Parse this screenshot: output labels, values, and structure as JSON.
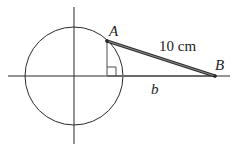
{
  "diagram": {
    "labels": {
      "point_a": "A",
      "point_b": "B",
      "segment_ab": "10 cm",
      "segment_b": "b"
    },
    "colors": {
      "stroke": "#2a2a2a",
      "segment_ab": "#555555",
      "segment_b": "#6a6a6a",
      "background": "#ffffff"
    },
    "geometry": {
      "circle": {
        "cx": 74,
        "cy": 76,
        "r": 49
      },
      "x_axis": {
        "x1": 8,
        "x2": 230,
        "y": 76
      },
      "y_axis": {
        "x": 74,
        "y1": 7,
        "y2": 144
      },
      "point_a": {
        "x": 107,
        "y": 41
      },
      "point_b": {
        "x": 215,
        "y": 76
      },
      "foot": {
        "x": 107,
        "y": 76
      },
      "right_angle_size": 9
    }
  }
}
